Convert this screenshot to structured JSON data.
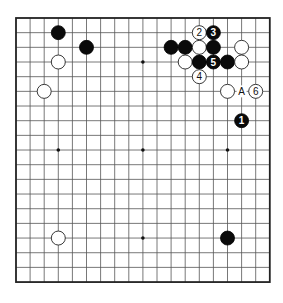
{
  "board": {
    "size": 19,
    "origin_x": 16,
    "origin_y": 18,
    "step_x": 14.1,
    "step_y": 14.67,
    "colors": {
      "line": "#555555",
      "black": "#0a0a0a",
      "white": "#ffffff"
    },
    "star_points": [
      [
        3,
        3
      ],
      [
        9,
        3
      ],
      [
        15,
        3
      ],
      [
        3,
        9
      ],
      [
        9,
        9
      ],
      [
        15,
        9
      ],
      [
        3,
        15
      ],
      [
        9,
        15
      ],
      [
        15,
        15
      ]
    ],
    "stones": [
      {
        "color": "black",
        "col": 3,
        "row": 1
      },
      {
        "color": "black",
        "col": 5,
        "row": 2
      },
      {
        "color": "white",
        "col": 3,
        "row": 3
      },
      {
        "color": "white",
        "col": 2,
        "row": 5
      },
      {
        "color": "black",
        "col": 11,
        "row": 2
      },
      {
        "color": "black",
        "col": 12,
        "row": 2
      },
      {
        "color": "white",
        "col": 13,
        "row": 2
      },
      {
        "color": "black",
        "col": 14,
        "row": 2
      },
      {
        "color": "white",
        "col": 16,
        "row": 2
      },
      {
        "color": "white",
        "col": 12,
        "row": 3
      },
      {
        "color": "black",
        "col": 13,
        "row": 3
      },
      {
        "color": "black",
        "col": 15,
        "row": 3
      },
      {
        "color": "white",
        "col": 16,
        "row": 3
      },
      {
        "color": "white",
        "col": 15,
        "row": 5
      },
      {
        "color": "white",
        "col": 3,
        "row": 15
      },
      {
        "color": "black",
        "col": 15,
        "row": 15
      }
    ],
    "numbered_moves": [
      {
        "number": "1",
        "color": "black",
        "col": 16,
        "row": 7
      },
      {
        "number": "2",
        "color": "white",
        "col": 13,
        "row": 1
      },
      {
        "number": "3",
        "color": "black",
        "col": 14,
        "row": 1
      },
      {
        "number": "4",
        "color": "white",
        "col": 13,
        "row": 4
      },
      {
        "number": "5",
        "color": "black",
        "col": 14,
        "row": 3
      },
      {
        "number": "6",
        "color": "white",
        "col": 17,
        "row": 5
      }
    ],
    "labels": [
      {
        "text": "A",
        "col": 16,
        "row": 5
      }
    ]
  }
}
